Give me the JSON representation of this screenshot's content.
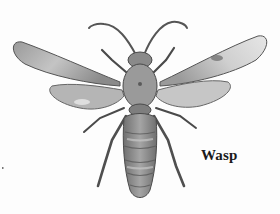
{
  "figure": {
    "style": "grayscale pencil drawing, dorsal view, wings spread",
    "label": "Wasp"
  },
  "colors": {
    "background": "#fdfdfd",
    "ink_dark": "#3a3a3a",
    "ink_mid": "#7a7a7a",
    "wing_fill": "#bdbdbd",
    "body_fill": "#8c8c8c",
    "label_text": "#1a1a1a"
  }
}
